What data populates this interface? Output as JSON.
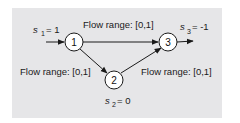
{
  "colors": {
    "background": "#ffffff",
    "panel": "#e6e6e8",
    "stroke": "#1a1a1a",
    "node_fill": "#ffffff"
  },
  "nodes": [
    {
      "id": "1",
      "label": "1",
      "supply_var": "s",
      "supply_sub": "1",
      "supply_value": "= 1"
    },
    {
      "id": "2",
      "label": "2",
      "supply_var": "s",
      "supply_sub": "2",
      "supply_value": "= 0"
    },
    {
      "id": "3",
      "label": "3",
      "supply_var": "s",
      "supply_sub": "3",
      "supply_value": "= -1"
    }
  ],
  "edges": [
    {
      "from": "1",
      "to": "3",
      "label": "Flow range: [0,1]"
    },
    {
      "from": "1",
      "to": "2",
      "label": "Flow range: [0,1]"
    },
    {
      "from": "2",
      "to": "3",
      "label": "Flow range: [0,1]"
    }
  ]
}
